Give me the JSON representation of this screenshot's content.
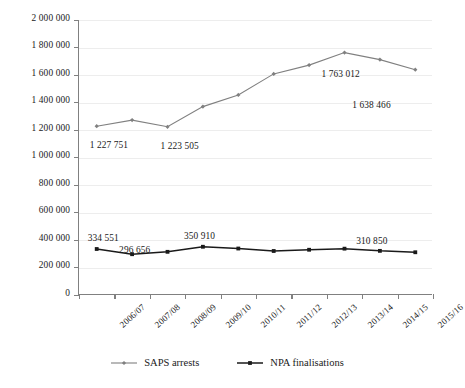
{
  "chart_data": {
    "type": "line",
    "title": "",
    "xlabel": "",
    "ylabel": "",
    "ylim": [
      0,
      2000000
    ],
    "grid": true,
    "legend_position": "bottom",
    "categories": [
      "2006/07",
      "2007/08",
      "2008/09",
      "2009/10",
      "2010/11",
      "2011/12",
      "2012/13",
      "2013/14",
      "2014/15",
      "2015/16"
    ],
    "ytick_labels": [
      "0",
      "200 000",
      "400 000",
      "600 000",
      "800 000",
      "1 000 000",
      "1 200 000",
      "1 400 000",
      "1 600 000",
      "1 800 000",
      "2 000 000"
    ],
    "ytick_values": [
      0,
      200000,
      400000,
      600000,
      800000,
      1000000,
      1200000,
      1400000,
      1600000,
      1800000,
      2000000
    ],
    "series": [
      {
        "name": "SAPS arrests",
        "color": "#808080",
        "marker": "diamond",
        "values": [
          1227751,
          1272000,
          1223505,
          1370000,
          1455000,
          1608000,
          1672000,
          1763012,
          1712000,
          1638466
        ],
        "point_labels": [
          {
            "index": 0,
            "text": "1 227 751"
          },
          {
            "index": 2,
            "text": "1 223 505"
          },
          {
            "index": 7,
            "text": "1 763 012"
          },
          {
            "index": 9,
            "text": "1 638 466"
          }
        ]
      },
      {
        "name": "NPA finalisations",
        "color": "#1a1a1a",
        "marker": "square",
        "values": [
          334551,
          296656,
          314000,
          350910,
          338000,
          320000,
          329000,
          337000,
          321000,
          310850
        ],
        "point_labels": [
          {
            "index": 0,
            "text": "334 551"
          },
          {
            "index": 1,
            "text": "296 656"
          },
          {
            "index": 3,
            "text": "350 910"
          },
          {
            "index": 9,
            "text": "310 850"
          }
        ]
      }
    ]
  },
  "legend": {
    "items": [
      {
        "label": "SAPS arrests",
        "color": "#808080",
        "marker": "diamond"
      },
      {
        "label": "NPA finalisations",
        "color": "#1a1a1a",
        "marker": "square"
      }
    ]
  }
}
